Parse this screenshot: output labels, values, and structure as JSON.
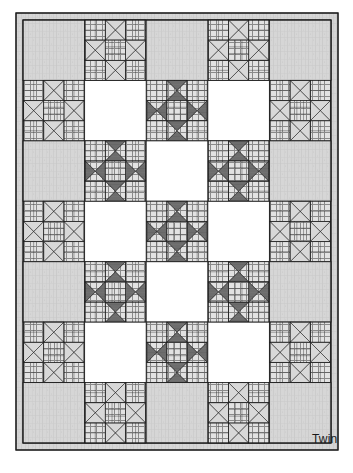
{
  "diagram": {
    "caption": "Twin",
    "canvas": {
      "width": 353,
      "height": 473
    },
    "quilt": {
      "x": 16,
      "y": 13,
      "width": 322,
      "height": 437,
      "border_strip_width": 7,
      "columns": 5,
      "rows": 7,
      "block_size": 61.6
    },
    "colors": {
      "background": "#ffffff",
      "outline": "#1c1c1c",
      "dark_fabric": "#6e6e6e",
      "light_print": "#d8d8d8",
      "light_texture": "#d4d4d4",
      "plain_white": "#ffffff",
      "grid_line": "#3a3a3a"
    },
    "legend": {
      "dark_star_label": "Dark star block",
      "light_star_label": "Light star block",
      "plain_light_label": "Plain textured square",
      "plain_white_label": "Plain white square"
    },
    "block_types": {
      "D": "dark-star-block",
      "L": "light-star-block",
      "T": "plain-textured-square",
      "W": "plain-white-square"
    },
    "layout_grid": [
      [
        "T",
        "L",
        "T",
        "L",
        "T"
      ],
      [
        "L",
        "W",
        "D",
        "W",
        "L"
      ],
      [
        "T",
        "D",
        "W",
        "D",
        "T"
      ],
      [
        "L",
        "W",
        "D",
        "W",
        "L"
      ],
      [
        "T",
        "D",
        "W",
        "D",
        "T"
      ],
      [
        "L",
        "W",
        "D",
        "W",
        "L"
      ],
      [
        "T",
        "L",
        "T",
        "L",
        "T"
      ]
    ]
  }
}
